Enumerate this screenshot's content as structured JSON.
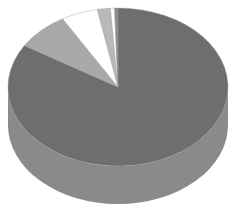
{
  "chart_data": {
    "type": "pie",
    "style": "3d",
    "title": "",
    "legend": "none",
    "labels_visible": false,
    "slices": [
      {
        "name": "Slice 1",
        "value": 83.8,
        "color": "#6e6e6e",
        "side_color": "#8a8a8a"
      },
      {
        "name": "Slice 2",
        "value": 7.8,
        "color": "#a9a9a9",
        "side_color": "#b5b5b5"
      },
      {
        "name": "Slice 3",
        "value": 5.4,
        "color": "#ffffff",
        "side_color": "#f2f2f2"
      },
      {
        "name": "Slice 4",
        "value": 1.9,
        "color": "#b9b9b9",
        "side_color": "#c4c4c4"
      },
      {
        "name": "Slice 5",
        "value": 0.6,
        "color": "#ffffff",
        "side_color": "#f2f2f2"
      },
      {
        "name": "Slice 6",
        "value": 0.5,
        "color": "#8c8c8c",
        "side_color": "#999999"
      }
    ],
    "start_angle_deg": 0,
    "direction": "counterclockwise-from-top-for-small-slices"
  },
  "geometry": {
    "cx": 118,
    "cy": 87,
    "rx": 110,
    "ry": 79,
    "depth": 38
  }
}
